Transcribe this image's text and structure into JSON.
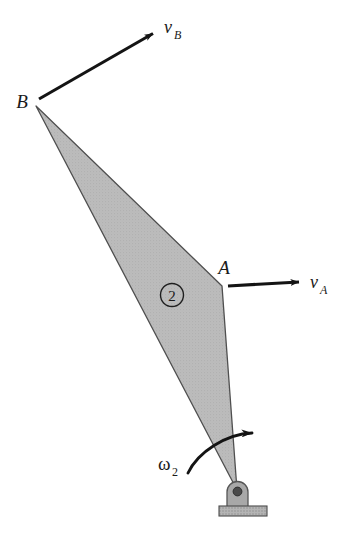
{
  "figure": {
    "type": "kinematics-diagram",
    "canvas": {
      "width": 353,
      "height": 541
    },
    "colors": {
      "body_fill": "#b9b9b9",
      "body_stroke": "#4a4a4a",
      "ink": "#1a1a1a",
      "pivot_block_fill": "#a9a9a9",
      "pivot_block_stroke": "#555555",
      "pivot_hole_fill": "#4d4d4d",
      "ground_fill": "#b0b0b0",
      "ground_stroke": "#4a4a4a",
      "background": "#ffffff"
    },
    "body": {
      "name": "link-2",
      "number_label": "2",
      "number_center": {
        "x": 172,
        "y": 295
      },
      "number_radius": 11,
      "vertices": [
        {
          "name": "B",
          "x": 36,
          "y": 106
        },
        {
          "name": "A",
          "x": 222,
          "y": 286
        },
        {
          "name": "O",
          "x": 237,
          "y": 490
        },
        {
          "name": "edge-left",
          "x": 132,
          "y": 280
        }
      ],
      "outline_points": "36,106 222,286 237,490 36,106"
    },
    "points": [
      {
        "label": "B",
        "name": "point-b",
        "x": 22,
        "y": 101
      },
      {
        "label": "A",
        "name": "point-a",
        "x": 224,
        "y": 267
      }
    ],
    "vectors": [
      {
        "name": "velocity-b",
        "symbol": "v",
        "subscript": "B",
        "tail": {
          "x": 39,
          "y": 99
        },
        "tip": {
          "x": 155,
          "y": 32
        },
        "label_pos": {
          "x": 164,
          "y": 30
        }
      },
      {
        "name": "velocity-a",
        "symbol": "v",
        "subscript": "A",
        "tail": {
          "x": 228,
          "y": 286
        },
        "tip": {
          "x": 301,
          "y": 281
        },
        "label_pos": {
          "x": 310,
          "y": 286
        }
      }
    ],
    "angular_velocity": {
      "name": "omega-2",
      "symbol": "ω",
      "subscript": "2",
      "label_pos": {
        "x": 160,
        "y": 469
      },
      "arc_path": "M 188,472 C 200,452 228,434 256,433",
      "arrow_tip": {
        "x": 262,
        "y": 433
      }
    },
    "support": {
      "name": "fixed-pivot-ground",
      "block": {
        "x": 227,
        "y": 481,
        "width": 21,
        "height": 26,
        "corner_radius": 10
      },
      "pivot_hole": {
        "cx": 237.5,
        "cy": 491,
        "r": 4.2
      },
      "ground_bar": {
        "x": 219,
        "y": 506,
        "width": 48,
        "height": 10
      }
    }
  }
}
